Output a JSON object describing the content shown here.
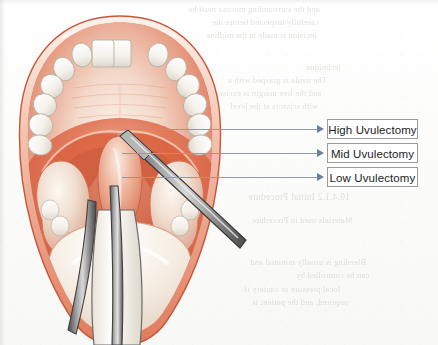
{
  "page": {
    "figure_caption": "",
    "background_color": "#fdfdfc"
  },
  "figure": {
    "anatomy": [
      {
        "name": "upper-lip",
        "label": "Upper lip"
      },
      {
        "name": "upper-teeth",
        "label": "Upper dental arch"
      },
      {
        "name": "hard-palate",
        "label": "Hard palate"
      },
      {
        "name": "soft-palate",
        "label": "Soft palate"
      },
      {
        "name": "uvula",
        "label": "Uvula"
      },
      {
        "name": "tonsil",
        "label": "Palatine tonsil"
      },
      {
        "name": "tongue",
        "label": "Tongue"
      }
    ],
    "instruments": [
      {
        "name": "scissors",
        "label": "Surgical scissors"
      },
      {
        "name": "forceps",
        "label": "Forceps"
      },
      {
        "name": "tongue-depressor",
        "label": "Tongue depressor"
      }
    ]
  },
  "annotations": {
    "arrow_color": "#6d7f96",
    "line_color": "#8e9bad",
    "labels": [
      {
        "id": "high",
        "text": "High Uvulectomy",
        "top": 119
      },
      {
        "id": "mid",
        "text": "Mid Uvulectomy",
        "top": 143
      },
      {
        "id": "low",
        "text": "Low Uvulectomy",
        "top": 167
      }
    ]
  },
  "bleed_text": {
    "note": "Faint mirrored show-through from the reverse side of the scanned page; not legible.",
    "lines": [
      {
        "text": "and the surrounding mucosa must be",
        "left": 188,
        "top": 4,
        "size": 8.5
      },
      {
        "text": "carefully inspected before the",
        "left": 212,
        "top": 17,
        "size": 8.5
      },
      {
        "text": "incision is made in the midline",
        "left": 206,
        "top": 30,
        "size": 8.5
      },
      {
        "text": "technique",
        "left": 306,
        "top": 62,
        "size": 8.5
      },
      {
        "text": "The uvula is grasped with a",
        "left": 228,
        "top": 75,
        "size": 8.5
      },
      {
        "text": "and the free margin is excised",
        "left": 214,
        "top": 88,
        "size": 8.5
      },
      {
        "text": "with scissors at the level",
        "left": 230,
        "top": 101,
        "size": 8.5
      },
      {
        "text": "10.4.1.2   Initial Procedure",
        "left": 248,
        "top": 192,
        "size": 9.5
      },
      {
        "text": "Materials used in Procedure",
        "left": 252,
        "top": 215,
        "size": 8.5
      },
      {
        "text": "Bleeding is usually minimal and",
        "left": 250,
        "top": 257,
        "size": 8.5
      },
      {
        "text": "can be controlled by",
        "left": 296,
        "top": 270,
        "size": 8.5
      },
      {
        "text": "local pressure or cautery if",
        "left": 244,
        "top": 284,
        "size": 8.5
      },
      {
        "text": "required, and the patient is",
        "left": 252,
        "top": 297,
        "size": 8.5
      }
    ]
  }
}
